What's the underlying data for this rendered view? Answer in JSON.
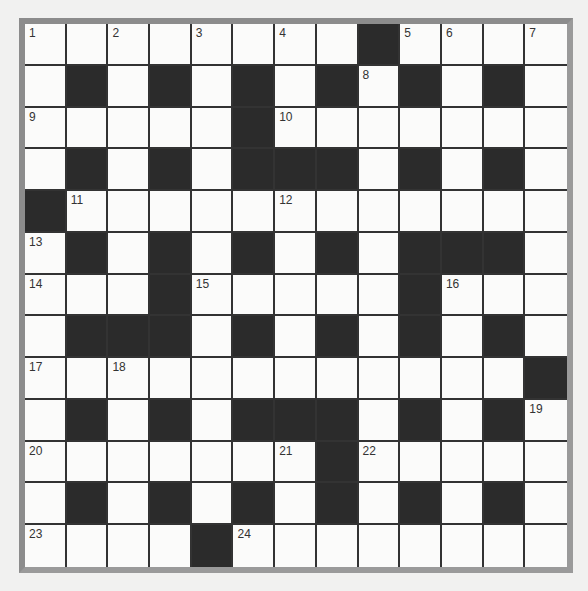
{
  "puzzle": {
    "type": "crossword",
    "rows": 13,
    "cols": 13,
    "colors": {
      "block": "#2b2b2b",
      "cell": "#fbfbfa",
      "frame": "#8c8c8c",
      "background": "#f1f1f0"
    },
    "layout": [
      "...........#....",
      "x"
    ],
    "grid": [
      [
        "1",
        "",
        "2",
        "",
        "3",
        "",
        "4",
        "",
        "#",
        "5",
        "6",
        "",
        "7"
      ],
      [
        "",
        "#",
        "",
        "#",
        "",
        "#",
        "",
        "#",
        "8",
        "#",
        "",
        "#",
        ""
      ],
      [
        "9",
        "",
        "",
        "",
        "",
        "#",
        "10",
        "",
        "",
        "",
        "",
        "",
        ""
      ],
      [
        "",
        "#",
        "",
        "#",
        "",
        "#",
        "#",
        "#",
        "",
        "#",
        "",
        "#",
        ""
      ],
      [
        "#",
        "11",
        "",
        "",
        "",
        "",
        "12",
        "",
        "",
        "",
        "",
        "",
        ""
      ],
      [
        "13",
        "#",
        "",
        "#",
        "",
        "#",
        "",
        "#",
        "",
        "#",
        "#",
        "#",
        ""
      ],
      [
        "14",
        "",
        "",
        "#",
        "15",
        "",
        "",
        "",
        "",
        "#",
        "16",
        "",
        ""
      ],
      [
        "",
        "#",
        "#",
        "#",
        "",
        "#",
        "",
        "#",
        "",
        "#",
        "",
        "#",
        ""
      ],
      [
        "17",
        "",
        "18",
        "",
        "",
        "",
        "",
        "",
        "",
        "",
        "",
        "",
        "#"
      ],
      [
        "",
        "#",
        "",
        "#",
        "",
        "#",
        "#",
        "#",
        "",
        "#",
        "",
        "#",
        "19"
      ],
      [
        "20",
        "",
        "",
        "",
        "",
        "",
        "21",
        "#",
        "22",
        "",
        "",
        "",
        ""
      ],
      [
        "",
        "#",
        "",
        "#",
        "",
        "#",
        "",
        "#",
        "",
        "#",
        "",
        "#",
        ""
      ],
      [
        "23",
        "",
        "",
        "",
        "#",
        "24",
        "",
        "",
        "",
        "",
        "",
        "",
        ""
      ]
    ]
  }
}
